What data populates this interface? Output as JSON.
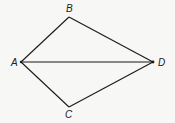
{
  "diagram": {
    "type": "quadrilateral-with-diagonal",
    "vertices": [
      {
        "id": "A",
        "label": "A",
        "x": 21,
        "y": 62,
        "label_x": 11,
        "label_y": 66
      },
      {
        "id": "B",
        "label": "B",
        "x": 69,
        "y": 17,
        "label_x": 66,
        "label_y": 12
      },
      {
        "id": "D",
        "label": "D",
        "x": 153,
        "y": 62,
        "label_x": 158,
        "label_y": 66
      },
      {
        "id": "C",
        "label": "C",
        "x": 69,
        "y": 107,
        "label_x": 65,
        "label_y": 118
      }
    ],
    "edges": [
      {
        "from": "A",
        "to": "B"
      },
      {
        "from": "B",
        "to": "D"
      },
      {
        "from": "D",
        "to": "C"
      },
      {
        "from": "C",
        "to": "A"
      },
      {
        "from": "A",
        "to": "D"
      }
    ],
    "colors": {
      "line": "#1a1a1a",
      "background": "#f7f7f5",
      "label": "#222222"
    }
  }
}
